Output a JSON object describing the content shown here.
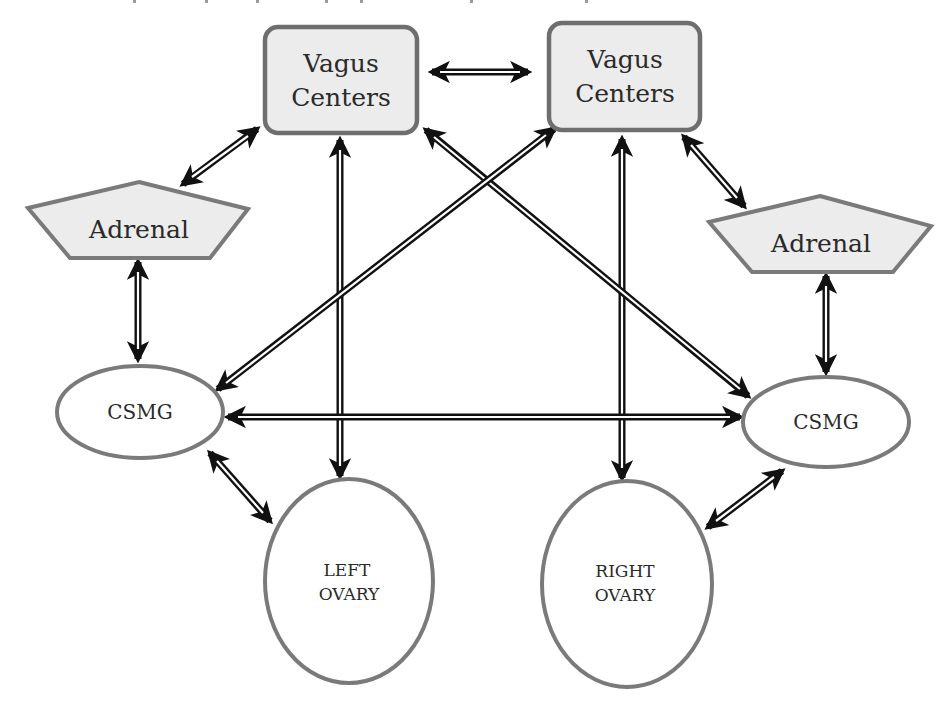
{
  "diagram": {
    "colors": {
      "node_fill_shaded": "#ececec",
      "node_fill_plain": "#ffffff",
      "node_stroke": "#7a7a7a",
      "arrow": "#111111",
      "background": "#ffffff"
    },
    "nodes": {
      "vagus_left": {
        "label_line1": "Vagus",
        "label_line2": "Centers",
        "shape": "rounded-rect"
      },
      "vagus_right": {
        "label_line1": "Vagus",
        "label_line2": "Centers",
        "shape": "rounded-rect"
      },
      "adrenal_left": {
        "label": "Adrenal",
        "shape": "pentagon"
      },
      "adrenal_right": {
        "label": "Adrenal",
        "shape": "pentagon"
      },
      "csmg_left": {
        "label": "CSMG",
        "shape": "ellipse"
      },
      "csmg_right": {
        "label": "CSMG",
        "shape": "ellipse"
      },
      "ovary_left": {
        "label_line1": "LEFT",
        "label_line2": "OVARY",
        "shape": "ellipse"
      },
      "ovary_right": {
        "label_line1": "RIGHT",
        "label_line2": "OVARY",
        "shape": "ellipse"
      }
    },
    "edges": [
      {
        "from": "vagus_left",
        "to": "vagus_right",
        "type": "bidirectional"
      },
      {
        "from": "vagus_left",
        "to": "adrenal_left",
        "type": "bidirectional"
      },
      {
        "from": "vagus_right",
        "to": "adrenal_right",
        "type": "bidirectional"
      },
      {
        "from": "vagus_left",
        "to": "ovary_left",
        "type": "bidirectional"
      },
      {
        "from": "vagus_right",
        "to": "ovary_right",
        "type": "bidirectional"
      },
      {
        "from": "vagus_left",
        "to": "csmg_right",
        "type": "bidirectional"
      },
      {
        "from": "vagus_right",
        "to": "csmg_left",
        "type": "bidirectional"
      },
      {
        "from": "adrenal_left",
        "to": "csmg_left",
        "type": "bidirectional"
      },
      {
        "from": "adrenal_right",
        "to": "csmg_right",
        "type": "bidirectional"
      },
      {
        "from": "csmg_left",
        "to": "csmg_right",
        "type": "bidirectional"
      },
      {
        "from": "csmg_left",
        "to": "ovary_left",
        "type": "bidirectional"
      },
      {
        "from": "csmg_right",
        "to": "ovary_right",
        "type": "bidirectional"
      }
    ]
  }
}
